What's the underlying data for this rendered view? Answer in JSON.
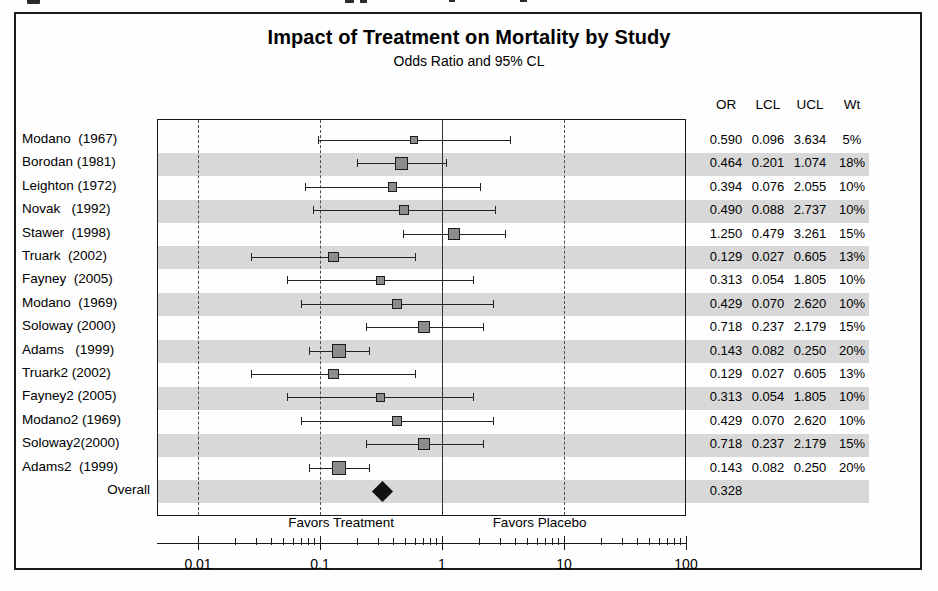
{
  "figure": {
    "title": "Impact of Treatment on Mortality by Study",
    "subtitle": "Odds Ratio and 95% CL"
  },
  "table": {
    "headers": [
      "OR",
      "LCL",
      "UCL",
      "Wt"
    ]
  },
  "axis": {
    "favors_left": "Favors Treatment",
    "favors_right": "Favors Placebo",
    "tick_labels": [
      "0.01",
      "0.1",
      "1",
      "10",
      "100"
    ],
    "tick_values": [
      0.01,
      0.1,
      1,
      10,
      100
    ],
    "scale": "log10",
    "range": [
      0.01,
      100
    ],
    "reference_line": 1
  },
  "chart_data": {
    "type": "forest",
    "title": "Impact of Treatment on Mortality by Study",
    "subtitle": "Odds Ratio and 95% CL",
    "xlabel": "Odds Ratio",
    "ylabel": "",
    "xscale": "log",
    "xlim": [
      0.01,
      100
    ],
    "xticks": [
      0.01,
      0.1,
      1,
      10,
      100
    ],
    "grid": "dashed vertical at 0.1 and 10; solid at 1 and 100",
    "legend": "none",
    "columns": [
      "Study",
      "OR",
      "LCL",
      "UCL",
      "Wt"
    ],
    "annotations": [
      "Favors Treatment",
      "Favors Placebo"
    ],
    "rows": [
      {
        "study": "Modano",
        "year": "1967",
        "label": "Modano  (1967)",
        "or": 0.59,
        "lcl": 0.096,
        "ucl": 3.634,
        "wt": "5%",
        "weight": 5
      },
      {
        "study": "Borodan",
        "year": "1981",
        "label": "Borodan (1981)",
        "or": 0.464,
        "lcl": 0.201,
        "ucl": 1.074,
        "wt": "18%",
        "weight": 18
      },
      {
        "study": "Leighton",
        "year": "1972",
        "label": "Leighton (1972)",
        "or": 0.394,
        "lcl": 0.076,
        "ucl": 2.055,
        "wt": "10%",
        "weight": 10
      },
      {
        "study": "Novak",
        "year": "1992",
        "label": "Novak   (1992)",
        "or": 0.49,
        "lcl": 0.088,
        "ucl": 2.737,
        "wt": "10%",
        "weight": 10
      },
      {
        "study": "Stawer",
        "year": "1998",
        "label": "Stawer  (1998)",
        "or": 1.25,
        "lcl": 0.479,
        "ucl": 3.261,
        "wt": "15%",
        "weight": 15
      },
      {
        "study": "Truark",
        "year": "2002",
        "label": "Truark  (2002)",
        "or": 0.129,
        "lcl": 0.027,
        "ucl": 0.605,
        "wt": "13%",
        "weight": 13
      },
      {
        "study": "Fayney",
        "year": "2005",
        "label": "Fayney  (2005)",
        "or": 0.313,
        "lcl": 0.054,
        "ucl": 1.805,
        "wt": "10%",
        "weight": 10
      },
      {
        "study": "Modano",
        "year": "1969",
        "label": "Modano  (1969)",
        "or": 0.429,
        "lcl": 0.07,
        "ucl": 2.62,
        "wt": "10%",
        "weight": 10
      },
      {
        "study": "Soloway",
        "year": "2000",
        "label": "Soloway (2000)",
        "or": 0.718,
        "lcl": 0.237,
        "ucl": 2.179,
        "wt": "15%",
        "weight": 15
      },
      {
        "study": "Adams",
        "year": "1999",
        "label": "Adams   (1999)",
        "or": 0.143,
        "lcl": 0.082,
        "ucl": 0.25,
        "wt": "20%",
        "weight": 20
      },
      {
        "study": "Truark2",
        "year": "2002",
        "label": "Truark2 (2002)",
        "or": 0.129,
        "lcl": 0.027,
        "ucl": 0.605,
        "wt": "13%",
        "weight": 13
      },
      {
        "study": "Fayney2",
        "year": "2005",
        "label": "Fayney2 (2005)",
        "or": 0.313,
        "lcl": 0.054,
        "ucl": 1.805,
        "wt": "10%",
        "weight": 10
      },
      {
        "study": "Modano2",
        "year": "1969",
        "label": "Modano2 (1969)",
        "or": 0.429,
        "lcl": 0.07,
        "ucl": 2.62,
        "wt": "10%",
        "weight": 10
      },
      {
        "study": "Soloway2",
        "year": "2000",
        "label": "Soloway2(2000)",
        "or": 0.718,
        "lcl": 0.237,
        "ucl": 2.179,
        "wt": "15%",
        "weight": 15
      },
      {
        "study": "Adams2",
        "year": "1999",
        "label": "Adams2  (1999)",
        "or": 0.143,
        "lcl": 0.082,
        "ucl": 0.25,
        "wt": "20%",
        "weight": 20
      }
    ],
    "overall": {
      "label": "Overall",
      "or": 0.328,
      "lcl": null,
      "ucl": null,
      "wt": "",
      "marker": "diamond"
    }
  },
  "colors": {
    "box_fill": "#8c8c8c",
    "box_stroke": "#1c1c1c",
    "band": "#cfcfcf",
    "diamond": "#111111",
    "frame": "#1a1a1a"
  }
}
